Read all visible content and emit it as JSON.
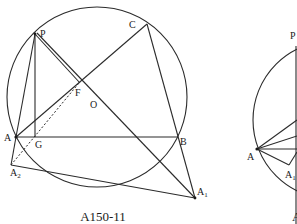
{
  "figures": [
    {
      "caption": "A150-11",
      "circle": {
        "cx": 97,
        "cy": 97,
        "r": 90,
        "center_label": "O"
      },
      "points": {
        "P": {
          "label": "P",
          "x": 35,
          "y": 34
        },
        "C": {
          "label": "C",
          "x": 147,
          "y": 24
        },
        "F": {
          "label": "F",
          "x": 79,
          "y": 81
        },
        "O": {
          "label": "O",
          "x": 97,
          "y": 97
        },
        "A": {
          "label": "A",
          "x": 16,
          "y": 137
        },
        "G": {
          "label": "G",
          "x": 35,
          "y": 137
        },
        "B": {
          "label": "B",
          "x": 178,
          "y": 137
        },
        "A2": {
          "label": "A",
          "sub": "2",
          "x": 11,
          "y": 165
        },
        "A1": {
          "label": "A",
          "sub": "1",
          "x": 195,
          "y": 198
        }
      }
    },
    {
      "caption": "A",
      "points": {
        "P": {
          "label": "P",
          "x": 296,
          "y": 46
        },
        "A": {
          "label": "A",
          "x": 257,
          "y": 149
        },
        "A1": {
          "label": "A",
          "sub": "1",
          "x": 289,
          "y": 165
        }
      }
    }
  ]
}
